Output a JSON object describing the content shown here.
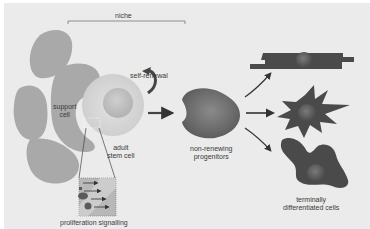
{
  "diagram": {
    "labels": {
      "niche": "niche",
      "self_renewal": "self-renewal",
      "support_cell_line1": "support",
      "support_cell_line2": "cell",
      "adult_stem_cell_line1": "adult",
      "adult_stem_cell_line2": "stem cell",
      "progenitors_line1": "non-renewing",
      "progenitors_line2": "progenitors",
      "differentiated_line1": "terminally",
      "differentiated_line2": "differentiated cells",
      "proliferation": "proliferation signalling"
    },
    "colors": {
      "background": "#ebebeb",
      "support_cell": "#a9a9a9",
      "stem_cell": "#d6d6d6",
      "progenitor": "#6e6e6e",
      "differentiated": "#4a4a4a",
      "arrow": "#333333"
    }
  }
}
